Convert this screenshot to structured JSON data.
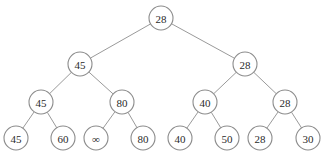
{
  "diagram": {
    "type": "binary-tree",
    "nodes": [
      {
        "id": "n0",
        "label": "28",
        "x": 161,
        "y": 18
      },
      {
        "id": "n1",
        "label": "45",
        "x": 80,
        "y": 64
      },
      {
        "id": "n2",
        "label": "28",
        "x": 245,
        "y": 64
      },
      {
        "id": "n3",
        "label": "45",
        "x": 41,
        "y": 102
      },
      {
        "id": "n4",
        "label": "80",
        "x": 122,
        "y": 102
      },
      {
        "id": "n5",
        "label": "40",
        "x": 205,
        "y": 102
      },
      {
        "id": "n6",
        "label": "28",
        "x": 285,
        "y": 102
      },
      {
        "id": "n7",
        "label": "45",
        "x": 16,
        "y": 138
      },
      {
        "id": "n8",
        "label": "60",
        "x": 63,
        "y": 138
      },
      {
        "id": "n9",
        "label": "∞",
        "x": 96,
        "y": 138
      },
      {
        "id": "n10",
        "label": "80",
        "x": 143,
        "y": 138
      },
      {
        "id": "n11",
        "label": "40",
        "x": 180,
        "y": 138
      },
      {
        "id": "n12",
        "label": "50",
        "x": 227,
        "y": 138
      },
      {
        "id": "n13",
        "label": "28",
        "x": 260,
        "y": 138
      },
      {
        "id": "n14",
        "label": "30",
        "x": 308,
        "y": 138
      }
    ],
    "edges": [
      [
        "n0",
        "n1"
      ],
      [
        "n0",
        "n2"
      ],
      [
        "n1",
        "n3"
      ],
      [
        "n1",
        "n4"
      ],
      [
        "n2",
        "n5"
      ],
      [
        "n2",
        "n6"
      ],
      [
        "n3",
        "n7"
      ],
      [
        "n3",
        "n8"
      ],
      [
        "n4",
        "n9"
      ],
      [
        "n4",
        "n10"
      ],
      [
        "n5",
        "n11"
      ],
      [
        "n5",
        "n12"
      ],
      [
        "n6",
        "n13"
      ],
      [
        "n6",
        "n14"
      ]
    ],
    "node_radius": 12,
    "colors": {
      "edge": "#9a9a9a",
      "node_stroke": "#8c8c8c",
      "node_fill": "#ffffff",
      "text": "#2a2a2a"
    }
  }
}
